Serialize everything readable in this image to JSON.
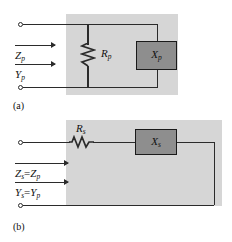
{
  "figure": {
    "type": "circuit-diagram",
    "colors": {
      "shade": "#d6d6d6",
      "wire": "#2b2b2b",
      "box_fill": "#8e8e8e",
      "box_border": "#1a1a1a",
      "text": "#111111",
      "background": "#ffffff"
    }
  },
  "panel_a": {
    "caption": "(a)",
    "topology": "parallel",
    "resistor": {
      "label_main": "R",
      "label_sub": "p",
      "orientation": "vertical"
    },
    "reactance_box": {
      "label_main": "X",
      "label_sub": "p"
    },
    "port_labels": [
      {
        "name": "impedance",
        "main": "Z",
        "sub": "p",
        "has_arrow": true
      },
      {
        "name": "admittance",
        "main": "Y",
        "sub": "p",
        "has_arrow": true
      }
    ],
    "terminals": [
      "top-terminal",
      "bottom-terminal"
    ]
  },
  "panel_b": {
    "caption": "(b)",
    "topology": "series",
    "resistor": {
      "label_main": "R",
      "label_sub": "s",
      "orientation": "horizontal"
    },
    "reactance_box": {
      "label_main": "X",
      "label_sub": "s"
    },
    "port_labels": [
      {
        "name": "impedance",
        "main": "Z",
        "sub": "s",
        "relation": "=",
        "equals_main": "Z",
        "equals_sub": "p",
        "has_arrow": true
      },
      {
        "name": "admittance",
        "main": "Y",
        "sub": "s",
        "relation": "=",
        "equals_main": "Y",
        "equals_sub": "p",
        "has_arrow": true
      }
    ],
    "terminals": [
      "top-terminal",
      "bottom-terminal"
    ]
  }
}
